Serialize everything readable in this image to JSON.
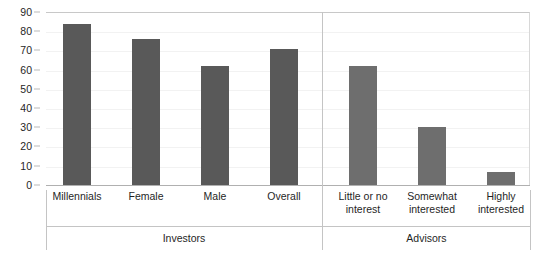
{
  "chart_data": {
    "type": "bar",
    "title": "",
    "subtitle": "",
    "xlabel": "",
    "ylabel": "",
    "ylim": [
      0,
      90
    ],
    "ytick_step": 10,
    "yticks": [
      90,
      80,
      70,
      60,
      50,
      40,
      30,
      20,
      10,
      0
    ],
    "grid": true,
    "legend": "none",
    "categories": [
      "Millennials",
      "Female",
      "Male",
      "Overall",
      "Little or no interest",
      "Somewhat interested",
      "Highly interested"
    ],
    "values": [
      84,
      76,
      62,
      71,
      62,
      30,
      7
    ],
    "groups": [
      {
        "label": "Investors",
        "categories": [
          "Millennials",
          "Female",
          "Male",
          "Overall"
        ],
        "values": [
          84,
          76,
          62,
          71
        ]
      },
      {
        "label": "Advisors",
        "categories": [
          "Little or no interest",
          "Somewhat interested",
          "Highly interested"
        ],
        "values": [
          62,
          30,
          7
        ]
      }
    ],
    "series": [
      {
        "name": "Percent",
        "values": [
          84,
          76,
          62,
          71,
          62,
          30,
          7
        ]
      }
    ]
  },
  "colors": {
    "bar_investors": "#595959",
    "bar_advisors": "#6e6e6e",
    "axis_line": "#b0b0b0",
    "gridline": "#f2f2f2",
    "separator": "#c4c4c4",
    "text": "#1f1f1f",
    "background": "#ffffff"
  },
  "category_label_lines": [
    [
      "Millennials"
    ],
    [
      "Female"
    ],
    [
      "Male"
    ],
    [
      "Overall"
    ],
    [
      "Little or no",
      "interest"
    ],
    [
      "Somewhat",
      "interested"
    ],
    [
      "Highly",
      "interested"
    ]
  ]
}
